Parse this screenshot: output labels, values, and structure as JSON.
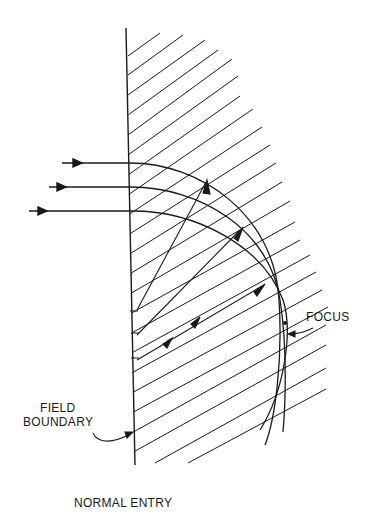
{
  "diagram": {
    "title": "NORMAL ENTRY",
    "labels": {
      "focus": "FOCUS",
      "field_boundary_line1": "FIELD",
      "field_boundary_line2": "BOUNDARY"
    },
    "elements": {
      "field_boundary": "vertical boundary line",
      "field_region": "hatched magnetic field region",
      "incident_rays": 3,
      "ray_arcs": 3,
      "focus_point": "convergence of arcs"
    },
    "colors": {
      "ink": "#1a1a1a",
      "background": "#ffffff"
    }
  }
}
